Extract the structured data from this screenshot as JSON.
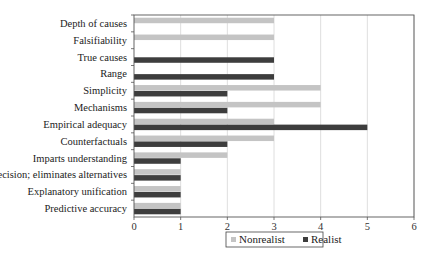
{
  "chart_data": {
    "type": "bar",
    "orientation": "horizontal",
    "title": "",
    "xlabel": "",
    "ylabel": "",
    "categories": [
      "Depth of causes",
      "Falsifiability",
      "True causes",
      "Range",
      "Simplicity",
      "Mechanisms",
      "Empirical adequacy",
      "Counterfactuals",
      "Imparts understanding",
      "Precision; eliminates alternatives",
      "Explanatory unification",
      "Predictive accuracy"
    ],
    "series": [
      {
        "name": "Nonrealist",
        "color": "#c4c4c4",
        "values": [
          3,
          3,
          0,
          0,
          4,
          4,
          3,
          3,
          2,
          1,
          1,
          1
        ]
      },
      {
        "name": "Realist",
        "color": "#3d3d3d",
        "values": [
          0,
          0,
          3,
          3,
          2,
          2,
          5,
          2,
          1,
          1,
          1,
          1
        ]
      }
    ],
    "xlim": [
      0,
      6
    ],
    "xticks": [
      0,
      1,
      2,
      3,
      4,
      5,
      6
    ],
    "grid": true,
    "legend_position": "bottom"
  }
}
